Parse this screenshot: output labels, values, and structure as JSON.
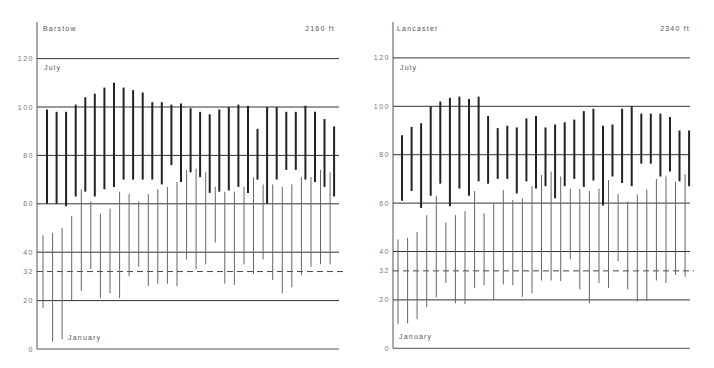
{
  "chart_data": [
    {
      "type": "range-bar",
      "station": "Barstow",
      "elevation": "2160 ft",
      "month_labels": {
        "high": "July",
        "low": "January"
      },
      "yticks": [
        0,
        20,
        32,
        40,
        60,
        80,
        100,
        120
      ],
      "ytick_labels": [
        "0",
        "20",
        "32",
        "40",
        "60",
        "80",
        "100",
        "120"
      ],
      "dashed_reference": 32,
      "ylim": [
        0,
        130
      ],
      "series": [
        {
          "name": "July",
          "style": "thick",
          "high": [
            99,
            98,
            98,
            101,
            104,
            105.5,
            108,
            110,
            108,
            107,
            106,
            102,
            102,
            101,
            101.5,
            99.5,
            98,
            97,
            99,
            100,
            101,
            100.5,
            91,
            100,
            100,
            98,
            98,
            100.5,
            98,
            95,
            92
          ],
          "low": [
            60,
            60,
            59,
            63,
            65,
            63,
            66,
            67,
            70,
            70,
            70,
            70,
            68,
            76,
            69,
            73,
            71,
            64.5,
            65,
            65.5,
            67,
            64.5,
            70,
            60,
            70,
            74,
            74,
            70,
            69,
            67,
            63
          ]
        },
        {
          "name": "January",
          "style": "thin",
          "high": [
            47,
            48,
            50,
            55,
            66,
            61,
            56,
            58,
            65,
            64,
            61,
            64,
            66,
            67,
            69,
            74,
            74.5,
            73,
            67,
            65,
            65,
            67,
            71,
            68,
            68,
            67,
            68,
            71,
            71,
            74,
            73
          ],
          "low": [
            17,
            3,
            4,
            20,
            24,
            33,
            21,
            23,
            21,
            30,
            34,
            26,
            27,
            27,
            26,
            37,
            33,
            35,
            44,
            27,
            26.5,
            35,
            31,
            37,
            28.5,
            23,
            25.5,
            30.5,
            34,
            35,
            35
          ]
        }
      ]
    },
    {
      "type": "range-bar",
      "station": "Lancaster",
      "elevation": "2340 ft",
      "month_labels": {
        "high": "July",
        "low": "January"
      },
      "yticks": [
        0,
        20,
        32,
        40,
        60,
        80,
        100,
        120
      ],
      "ytick_labels": [
        "0",
        "20",
        "32",
        "40",
        "60",
        "80",
        "100",
        "120"
      ],
      "dashed_reference": 32,
      "ylim": [
        0,
        130
      ],
      "series": [
        {
          "name": "July",
          "style": "thick",
          "high": [
            88,
            91.5,
            93,
            100,
            102,
            103.5,
            104,
            103,
            104,
            96,
            91,
            92,
            91.3,
            95,
            96,
            91.3,
            92.5,
            93.4,
            94.5,
            98,
            99,
            92,
            92.5,
            99,
            100,
            97,
            97,
            97,
            95.6,
            90,
            90
          ],
          "low": [
            61,
            65,
            58,
            63,
            68,
            58.7,
            66,
            63,
            69,
            68,
            70,
            70,
            64,
            69,
            66,
            67,
            62,
            67,
            70,
            66.7,
            69.3,
            59,
            71,
            68.3,
            67,
            76.3,
            76.3,
            71,
            73,
            69,
            67
          ]
        },
        {
          "name": "January",
          "style": "thin",
          "high": [
            45,
            45.7,
            48,
            55,
            63,
            52,
            55,
            56.7,
            65,
            55.8,
            60,
            65.4,
            61.3,
            62,
            67,
            71.6,
            73,
            71,
            66,
            65.8,
            65,
            66,
            69.5,
            63.8,
            60.6,
            63.6,
            65.7,
            70,
            71,
            68.8,
            72
          ],
          "low": [
            10,
            10.3,
            12,
            17,
            21,
            27,
            18.6,
            18.3,
            25,
            26,
            20,
            26.4,
            26,
            21.3,
            22.7,
            28,
            28,
            27.8,
            36.8,
            24.4,
            18.6,
            27,
            25,
            36,
            24.4,
            19.3,
            19.5,
            28,
            27,
            30.3,
            29.6
          ]
        }
      ]
    }
  ]
}
